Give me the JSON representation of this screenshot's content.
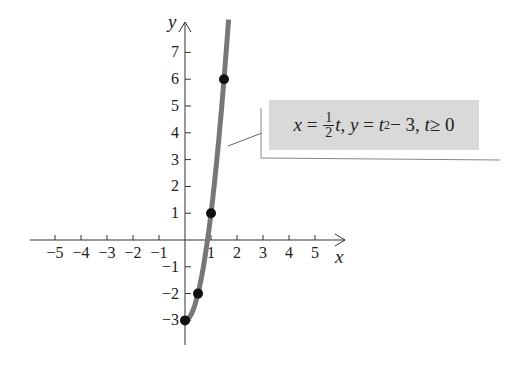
{
  "chart_data": {
    "type": "line",
    "title": "",
    "xlabel": "x",
    "ylabel": "y",
    "xlim": [
      -5.5,
      6
    ],
    "ylim": [
      -4,
      8
    ],
    "grid": false,
    "x_ticks": [
      -5,
      -4,
      -3,
      -2,
      -1,
      1,
      2,
      3,
      4,
      5
    ],
    "y_ticks": [
      -3,
      -2,
      -1,
      1,
      2,
      3,
      4,
      5,
      6,
      7
    ],
    "x_tick_labels": [
      "−5",
      "−4",
      "−3",
      "−2",
      "−1",
      "1",
      "2",
      "3",
      "4",
      "5"
    ],
    "y_tick_labels": [
      "−3",
      "−2",
      "−1",
      "1",
      "2",
      "3",
      "4",
      "5",
      "6",
      "7"
    ],
    "series": [
      {
        "name": "x = (1/2)t, y = t² − 3, t ≥ 0",
        "kind": "parametric-curve",
        "t_range": [
          0,
          3.35
        ],
        "color": "#777777"
      }
    ],
    "points": [
      {
        "x": 0,
        "y": -3
      },
      {
        "x": 0.5,
        "y": -2
      },
      {
        "x": 1,
        "y": 1
      },
      {
        "x": 1.5,
        "y": 6
      }
    ],
    "annotation": {
      "equation": {
        "x_lhs": "x",
        "eq1": "=",
        "frac_num": "1",
        "frac_den": "2",
        "x_rhs_var": "t",
        "sep1": ",",
        "y_lhs": "y",
        "eq2": "=",
        "y_var": "t",
        "y_exp": "2",
        "y_rest": " − 3",
        "sep2": ",",
        "t_var": "t",
        "cond": " ≥ 0"
      }
    }
  },
  "axes": {
    "x_name": "x",
    "y_name": "y"
  },
  "colors": {
    "curve": "#777777",
    "point": "#111111",
    "axis": "#333333",
    "box": "#d9d9d9"
  }
}
